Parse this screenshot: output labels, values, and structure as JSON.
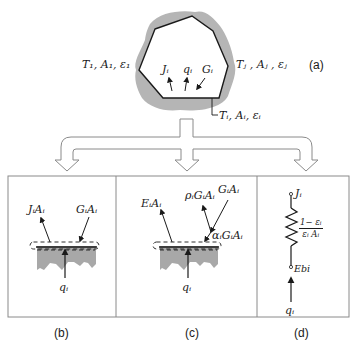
{
  "figure": {
    "panel_a": {
      "caption": "(a)",
      "label_surface_1": "T₁, A₁, ε₁",
      "label_surface_j": "Tⱼ , Aⱼ , εⱼ",
      "label_surface_i": "Tᵢ, Aᵢ, εᵢ",
      "flux_labels": [
        "Jᵢ",
        "qᵢ",
        "Gᵢ"
      ]
    },
    "panel_b": {
      "caption": "(b)",
      "outgoing_label": "JᵢAᵢ",
      "incoming_label": "GᵢAᵢ",
      "net_label": "qᵢ"
    },
    "panel_c": {
      "caption": "(c)",
      "emitted_label": "EᵢAᵢ",
      "reflected_label": "ρᵢGᵢAᵢ",
      "incident_label": "GᵢAᵢ",
      "absorbed_label": "αᵢGᵢAᵢ",
      "net_label": "qᵢ"
    },
    "panel_d": {
      "caption": "(d)",
      "top_node_label": "Jᵢ",
      "resistance_numerator": "1− εᵢ",
      "resistance_denominator": "εᵢ Aᵢ",
      "bottom_node_label": "Ebi",
      "net_label": "qᵢ"
    },
    "colors": {
      "line": "#1a1a1a",
      "shading": "#b5b5b5",
      "frame": "#8a8a8a"
    }
  }
}
